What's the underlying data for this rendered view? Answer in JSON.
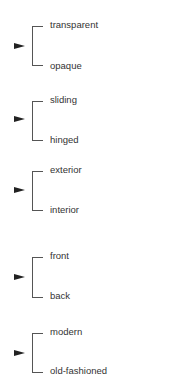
{
  "pairs": [
    {
      "top": "transparent",
      "bottom": "opaque"
    },
    {
      "top": "sliding",
      "bottom": "hinged"
    },
    {
      "top": "exterior",
      "bottom": "interior"
    },
    {
      "top": "front",
      "bottom": "back"
    },
    {
      "top": "modern",
      "bottom": "old-fashioned"
    }
  ],
  "icons": {
    "pointer": "right-pointing-triangle-arrow"
  },
  "colors": {
    "line": "#555555",
    "text": "#333333",
    "arrow": "#222222"
  }
}
